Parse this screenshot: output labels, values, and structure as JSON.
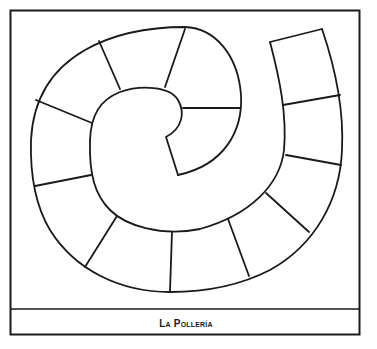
{
  "board": {
    "title": "La Pollería",
    "type": "spiral game board",
    "cell_count": 16,
    "colors": {
      "line": "#1a1a1a",
      "background": "#ffffff"
    }
  }
}
